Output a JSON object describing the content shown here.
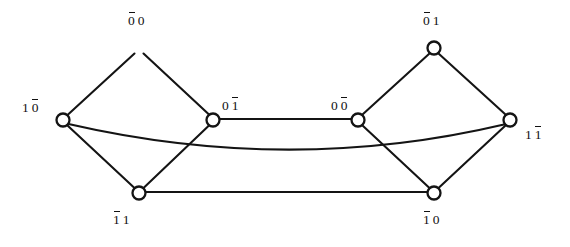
{
  "figure": {
    "type": "undirected-graph-diagram",
    "width": 570,
    "height": 247,
    "background_color": "#ffffff",
    "stroke_color": "#141414",
    "node_fill_color": "#ffffff",
    "label_color": "#111111"
  },
  "nodes": [
    {
      "id": "n_0b0",
      "label": "0̄0",
      "label_text": "00",
      "overbar_index": 0,
      "x": 139,
      "y": 48,
      "r": 6.5,
      "label_x": 128,
      "label_y": 14,
      "label_align": "left"
    },
    {
      "id": "n_0b1",
      "label": "0̄1",
      "label_text": "01",
      "overbar_index": 0,
      "x": 434,
      "y": 48,
      "r": 6.5,
      "label_x": 423,
      "label_y": 14,
      "label_align": "left"
    },
    {
      "id": "n_10b",
      "label": "10̄",
      "label_text": "10",
      "overbar_index": 1,
      "x": 63,
      "y": 120,
      "r": 6.5,
      "label_x": 22,
      "label_y": 101,
      "label_align": "left"
    },
    {
      "id": "n_01b",
      "label": "01̄",
      "label_text": "01",
      "overbar_index": 1,
      "x": 213,
      "y": 120,
      "r": 6.5,
      "label_x": 222,
      "label_y": 99,
      "label_align": "left"
    },
    {
      "id": "n_00b",
      "label": "00̄",
      "label_text": "00",
      "overbar_index": 1,
      "x": 358,
      "y": 120,
      "r": 6.5,
      "label_x": 331,
      "label_y": 99,
      "label_align": "left"
    },
    {
      "id": "n_11b",
      "label": "11̄",
      "label_text": "11",
      "overbar_index": 1,
      "x": 510,
      "y": 120,
      "r": 6.5,
      "label_x": 525,
      "label_y": 128,
      "label_align": "left"
    },
    {
      "id": "n_1b1",
      "label": "1̄1",
      "label_text": "11",
      "overbar_index": 0,
      "x": 139,
      "y": 193,
      "r": 6.5,
      "label_x": 113,
      "label_y": 213,
      "label_align": "left"
    },
    {
      "id": "n_1b0",
      "label": "1̄0",
      "label_text": "10",
      "overbar_index": 0,
      "x": 434,
      "y": 193,
      "r": 6.5,
      "label_x": 423,
      "label_y": 213,
      "label_align": "left"
    }
  ],
  "edges": [
    {
      "id": "e1",
      "from": "n_0b0",
      "to": "n_0b1",
      "shape": "straight",
      "path": "M 145.5 46.5 L 427.5 46.5"
    },
    {
      "id": "e2",
      "from": "n_10b",
      "to": "n_0b0",
      "shape": "straight",
      "path": "M 67.5 115.0 L 134.5 53.5"
    },
    {
      "id": "e3",
      "from": "n_0b0",
      "to": "n_01b",
      "shape": "straight",
      "path": "M 143.5 53.5 L 209.0 114.5"
    },
    {
      "id": "e4",
      "from": "n_10b",
      "to": "n_1b1",
      "shape": "straight",
      "path": "M 67.5 125.5 L 134.5 188.0"
    },
    {
      "id": "e5",
      "from": "n_01b",
      "to": "n_1b1",
      "shape": "straight",
      "path": "M 209.0 125.5 L 143.5 188.0"
    },
    {
      "id": "e6",
      "from": "n_01b",
      "to": "n_00b",
      "shape": "straight",
      "path": "M 219.5 119.0 L 351.5 119.0"
    },
    {
      "id": "e7",
      "from": "n_00b",
      "to": "n_0b1",
      "shape": "straight",
      "path": "M 362.5 114.5 L 429.5 53.5"
    },
    {
      "id": "e8",
      "from": "n_0b1",
      "to": "n_11b",
      "shape": "straight",
      "path": "M 438.5 53.5 L 505.5 114.5"
    },
    {
      "id": "e9",
      "from": "n_00b",
      "to": "n_1b0",
      "shape": "straight",
      "path": "M 362.5 125.5 L 429.5 188.0"
    },
    {
      "id": "e10",
      "from": "n_1b0",
      "to": "n_11b",
      "shape": "straight",
      "path": "M 438.5 188.0 L 505.5 125.5"
    },
    {
      "id": "e11",
      "from": "n_1b1",
      "to": "n_1b0",
      "shape": "straight",
      "path": "M 145.5 192.0 L 427.5 192.0"
    },
    {
      "id": "e12",
      "from": "n_10b",
      "to": "n_11b",
      "shape": "curved-sag",
      "path": "M 68.5 124.0 Q 290 175 504.0 124.5"
    }
  ]
}
